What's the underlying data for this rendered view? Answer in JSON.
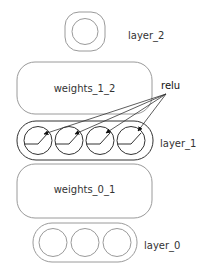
{
  "diagram": {
    "type": "neural-network",
    "layers": [
      {
        "name": "layer_2",
        "label": "layer_2",
        "neurons": 1
      },
      {
        "name": "weights_1_2",
        "label": "weights_1_2"
      },
      {
        "name": "layer_1",
        "label": "layer_1",
        "neurons": 4,
        "activation": "relu"
      },
      {
        "name": "weights_0_1",
        "label": "weights_0_1"
      },
      {
        "name": "layer_0",
        "label": "layer_0",
        "neurons": 3
      }
    ],
    "annotation": {
      "label": "relu",
      "points_to": "layer_1 neurons"
    }
  },
  "labels": {
    "layer_2": "layer_2",
    "weights_1_2": "weights_1_2",
    "relu": "relu",
    "layer_1": "layer_1",
    "weights_0_1": "weights_0_1",
    "layer_0": "layer_0"
  },
  "colors": {
    "stroke_light": "#9a9a9a",
    "stroke_dark": "#333333",
    "text": "#333333"
  }
}
